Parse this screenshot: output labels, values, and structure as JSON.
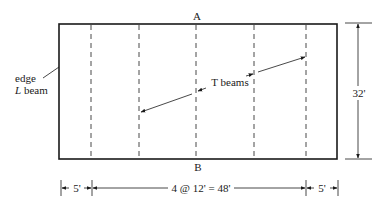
{
  "diagram": {
    "type": "structural floor plan",
    "labels": {
      "section_top": "A",
      "section_bottom": "B",
      "edge_line1": "edge",
      "edge_line2_italic": "L",
      "edge_line2_rest": " beam",
      "t_beams": "T beams",
      "height_dim": "32'",
      "left_span": "5'",
      "middle_span": "4 @ 12' = 48'",
      "right_span": "5'"
    },
    "colors": {
      "line": "#1a1a1a",
      "dash": "#333333",
      "background": "#ffffff"
    },
    "geometry": {
      "outline": {
        "x": 59,
        "y": 24,
        "w": 278,
        "h": 135
      },
      "interior_beams_x": [
        91,
        139,
        196,
        254,
        306
      ],
      "beam_count": 5
    }
  }
}
